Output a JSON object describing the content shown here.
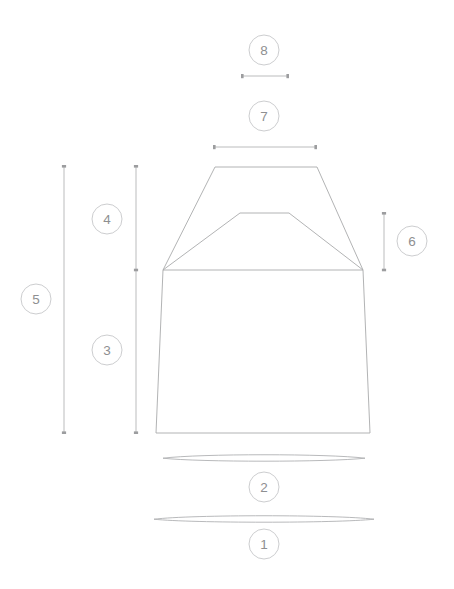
{
  "diagram": {
    "type": "technical-measurement-drawing",
    "background_color": "#ffffff",
    "stroke_color": "#a9aaac",
    "dimension_line_color": "#b3b4b6",
    "callout_stroke_color": "#c6c7c9",
    "callout_text_color": "#8e8f91",
    "callouts": [
      {
        "id": "callout-1",
        "label": "1",
        "cx": 264,
        "cy": 544,
        "r": 15,
        "measures": "bottom-hem-sweep-lens",
        "orientation": "horizontal"
      },
      {
        "id": "callout-2",
        "label": "2",
        "cx": 264,
        "cy": 487,
        "r": 15,
        "measures": "upper-hem-lens",
        "orientation": "horizontal"
      },
      {
        "id": "callout-3",
        "label": "3",
        "cx": 107,
        "cy": 350,
        "r": 15,
        "measures": "body-length-lower",
        "orientation": "vertical"
      },
      {
        "id": "callout-4",
        "label": "4",
        "cx": 107,
        "cy": 219,
        "r": 15,
        "measures": "yoke-height-upper",
        "orientation": "vertical"
      },
      {
        "id": "callout-5",
        "label": "5",
        "cx": 36,
        "cy": 299,
        "r": 15,
        "measures": "total-length",
        "orientation": "vertical"
      },
      {
        "id": "callout-6",
        "label": "6",
        "cx": 412,
        "cy": 241,
        "r": 15,
        "measures": "armhole-drop",
        "orientation": "vertical"
      },
      {
        "id": "callout-7",
        "label": "7",
        "cx": 264,
        "cy": 116,
        "r": 15,
        "measures": "top-width",
        "orientation": "horizontal"
      },
      {
        "id": "callout-8",
        "label": "8",
        "cx": 264,
        "cy": 50,
        "r": 15,
        "measures": "neck-opening-width",
        "orientation": "horizontal"
      }
    ],
    "dimension_lines": [
      {
        "id": "dim-8",
        "orientation": "horizontal",
        "x1": 242,
        "y1": 76,
        "x2": 288,
        "y2": 76
      },
      {
        "id": "dim-7",
        "orientation": "horizontal",
        "x1": 214,
        "y1": 147,
        "x2": 316,
        "y2": 147
      },
      {
        "id": "dim-5",
        "orientation": "vertical",
        "x1": 64,
        "y1": 166,
        "x2": 64,
        "y2": 433
      },
      {
        "id": "dim-4",
        "orientation": "vertical",
        "x1": 136,
        "y1": 166,
        "x2": 136,
        "y2": 270
      },
      {
        "id": "dim-3",
        "orientation": "vertical",
        "x1": 136,
        "y1": 270,
        "x2": 136,
        "y2": 433
      },
      {
        "id": "dim-6",
        "orientation": "vertical",
        "x1": 384,
        "y1": 213,
        "x2": 384,
        "y2": 270
      }
    ],
    "garment_paths": {
      "outer_body": "M 215 167 L 317 167 L 363 270 L 370 433 L 156 433 L 163 270 Z",
      "inner_yoke": "M 240 213 L 289 213 L 363 270 L 163 270 Z",
      "notes": "outer trapezoid shoulder panel with inner yoke panel and tapered body"
    },
    "lens_shapes": [
      {
        "id": "lens-upper",
        "cx": 264,
        "cy": 458,
        "rx": 101,
        "ry": 3.4
      },
      {
        "id": "lens-lower",
        "cx": 264,
        "cy": 519,
        "rx": 110,
        "ry": 3.4
      }
    ]
  }
}
